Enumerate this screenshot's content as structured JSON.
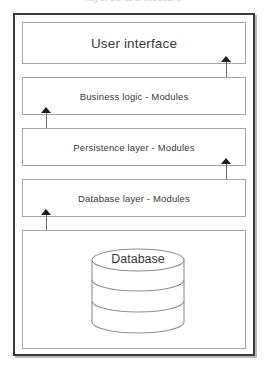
{
  "caption_remnant": "layered architecture",
  "colors": {
    "frame_border": "#3c3c3c",
    "frame_shadow": "#b9b9b9",
    "box_border": "#a6a6a6",
    "text": "#3a3a3a",
    "arrow": "#1d1d1d",
    "shaft": "#6a6a6a",
    "cylinder_stroke": "#8f8f8f",
    "background": "#ffffff"
  },
  "diagram": {
    "type": "layered-architecture-diagram",
    "layers": [
      {
        "id": "user-interface",
        "label": "User interface"
      },
      {
        "id": "business-logic",
        "label": "Business logic - Modules"
      },
      {
        "id": "persistence",
        "label": "Persistence layer - Modules"
      },
      {
        "id": "database-layer",
        "label": "Database layer - Modules"
      },
      {
        "id": "database",
        "label": "Database"
      }
    ],
    "connectors": [
      {
        "id": "ui-to-business-logic",
        "from": "user-interface",
        "to": "business-logic",
        "style": "double-headed",
        "side": "right"
      },
      {
        "id": "business-logic-to-persistence",
        "from": "business-logic",
        "to": "persistence",
        "style": "double-headed",
        "side": "left"
      },
      {
        "id": "persistence-to-database-layer",
        "from": "persistence",
        "to": "database-layer",
        "style": "double-headed",
        "side": "right"
      },
      {
        "id": "database-layer-to-database",
        "from": "database-layer",
        "to": "database",
        "style": "double-headed",
        "side": "left"
      }
    ],
    "cylinder": {
      "label": "Database",
      "segments": 3
    }
  }
}
